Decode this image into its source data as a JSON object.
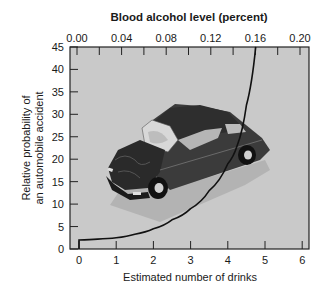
{
  "chart_data": {
    "type": "line",
    "title": "Blood alcohol level (percent)",
    "xlabel": "Estimated number of drinks",
    "ylabel_line1": "Relative probability of",
    "ylabel_line2": "an automobile accident",
    "ylabel": "Relative probability of an automobile accident",
    "x_ticks": [
      "0",
      "1",
      "2",
      "3",
      "4",
      "5",
      "6"
    ],
    "y_ticks": [
      "0",
      "5",
      "10",
      "15",
      "20",
      "25",
      "30",
      "35",
      "40",
      "45"
    ],
    "top_axis_label": "Blood alcohol level (percent)",
    "top_ticks": [
      "0.00",
      "0.04",
      "0.08",
      "0.12",
      "0.16",
      "0.20"
    ],
    "xlim": [
      0,
      6
    ],
    "ylim": [
      0,
      45
    ],
    "top_xlim": [
      0.0,
      0.2
    ],
    "grid": false,
    "legend": null,
    "series": [
      {
        "name": "Relative probability of accident",
        "x": [
          0,
          0.5,
          1,
          1.5,
          2,
          2.5,
          3,
          3.5,
          4,
          4.25,
          4.5,
          4.75
        ],
        "y": [
          2,
          2.2,
          2.5,
          3.3,
          4.5,
          6.5,
          9,
          13,
          19,
          23,
          32,
          45
        ]
      }
    ],
    "annotations": [
      "Illustration of a crashed car with crumpled hood in plot area"
    ],
    "colors": {
      "plot_background": "#c8c8c8",
      "curve": "#111111",
      "axis": "#222222",
      "car_body": "#3a3a3a"
    }
  }
}
